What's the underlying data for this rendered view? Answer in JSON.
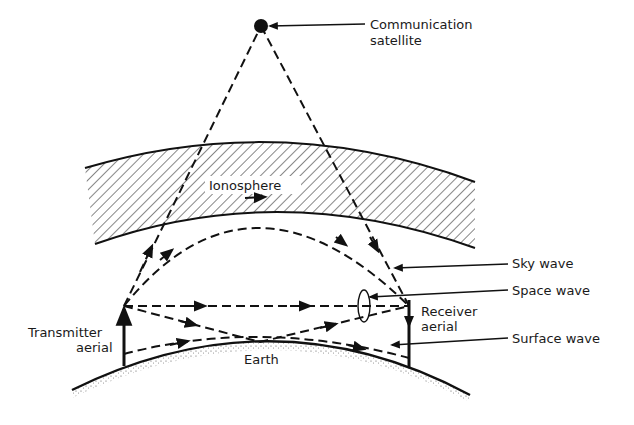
{
  "diagram": {
    "labels": {
      "satellite_line1": "Communication",
      "satellite_line2": "satellite",
      "ionosphere": "Ionosphere",
      "sky_wave": "Sky wave",
      "space_wave": "Space wave",
      "surface_wave": "Surface wave",
      "receiver_line1": "Receiver",
      "receiver_line2": "aerial",
      "transmitter_line1": "Transmitter",
      "transmitter_line2": "aerial",
      "earth": "Earth"
    },
    "colors": {
      "ink": "#111111",
      "background": "#ffffff"
    }
  }
}
